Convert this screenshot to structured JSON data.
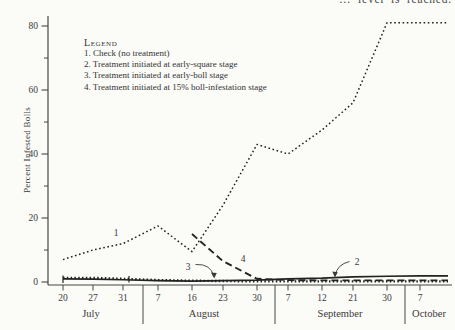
{
  "top_caption": "… level is reached.",
  "colors": {
    "ink": "#474747",
    "curve": "#222222",
    "background": "#fbfbf8"
  },
  "y_axis": {
    "title": "Percent Infested Bolls",
    "ticks": [
      "0",
      "20",
      "40",
      "60",
      "80"
    ]
  },
  "x_axis": {
    "date_ticks": [
      "20",
      "27",
      "31",
      "7",
      "16",
      "23",
      "30",
      "7",
      "12",
      "21",
      "30",
      "7"
    ],
    "months": [
      "July",
      "August",
      "September",
      "October"
    ]
  },
  "legend": {
    "title": "Legend",
    "items": [
      "1.  Check (no treatment)",
      "2.  Treatment initiated at early-square stage",
      "3.  Treatment initiated at early-boll stage",
      "4.  Treatment initiated at 15% boll-infestation stage"
    ]
  },
  "annotations": {
    "c1": "1",
    "c2": "2",
    "c3": "3",
    "c4": "4"
  },
  "chart_data": {
    "type": "line",
    "title": "",
    "xlabel": "",
    "ylabel": "Percent Infested Bolls",
    "ylim": [
      0,
      85
    ],
    "grid": false,
    "legend_position": "upper-left",
    "x": [
      "Jul 20",
      "Jul 27",
      "Jul 31",
      "Aug 7",
      "Aug 16",
      "Aug 23",
      "Aug 30",
      "Sep 7",
      "Sep 12",
      "Sep 21",
      "Sep 30",
      "Oct 7"
    ],
    "series": [
      {
        "name": "1. Check (no treatment)",
        "style": "fine-dotted",
        "values": [
          7,
          10,
          12,
          17.5,
          9.5,
          24,
          43,
          40,
          47.5,
          56,
          81,
          81
        ]
      },
      {
        "name": "2. Treatment initiated at early-square stage",
        "style": "solid",
        "values": [
          1,
          0.9,
          0.7,
          0.4,
          0.3,
          0.4,
          0.6,
          1,
          1.2,
          1.6,
          1.8,
          1.9
        ]
      },
      {
        "name": "3. Treatment initiated at early-boll stage",
        "style": "coarse-dotted",
        "values": [
          1.3,
          1.3,
          1,
          0.6,
          0.4,
          0.3,
          0.2,
          0.2,
          0.2,
          0.2,
          0.2,
          0.2
        ]
      },
      {
        "name": "4. Treatment initiated at 15% boll-infestation stage",
        "style": "dashed",
        "values": [
          null,
          null,
          null,
          null,
          15,
          6.5,
          1,
          0.6,
          0.5,
          0.5,
          0.5,
          0.5
        ]
      }
    ]
  }
}
